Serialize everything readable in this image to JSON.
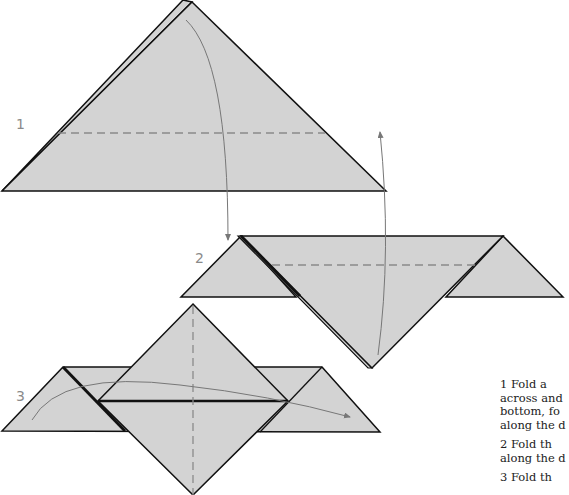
{
  "colors": {
    "paper_fill": "#d3d3d3",
    "outline": "#111111",
    "crease": "#8a8a8a",
    "arrow": "#777777",
    "background": "#ffffff"
  },
  "steps": [
    {
      "number": "1",
      "label_pos": [
        16,
        124
      ]
    },
    {
      "number": "2",
      "label_pos": [
        195,
        252
      ]
    },
    {
      "number": "3",
      "label_pos": [
        16,
        388
      ]
    }
  ],
  "instructions": [
    {
      "number": "1",
      "lines": [
        "1  Fold a",
        "across and",
        "bottom, fo",
        "along the d"
      ]
    },
    {
      "number": "2",
      "lines": [
        "2  Fold th",
        "along the d"
      ]
    },
    {
      "number": "3",
      "lines": [
        "3  Fold th"
      ]
    }
  ]
}
